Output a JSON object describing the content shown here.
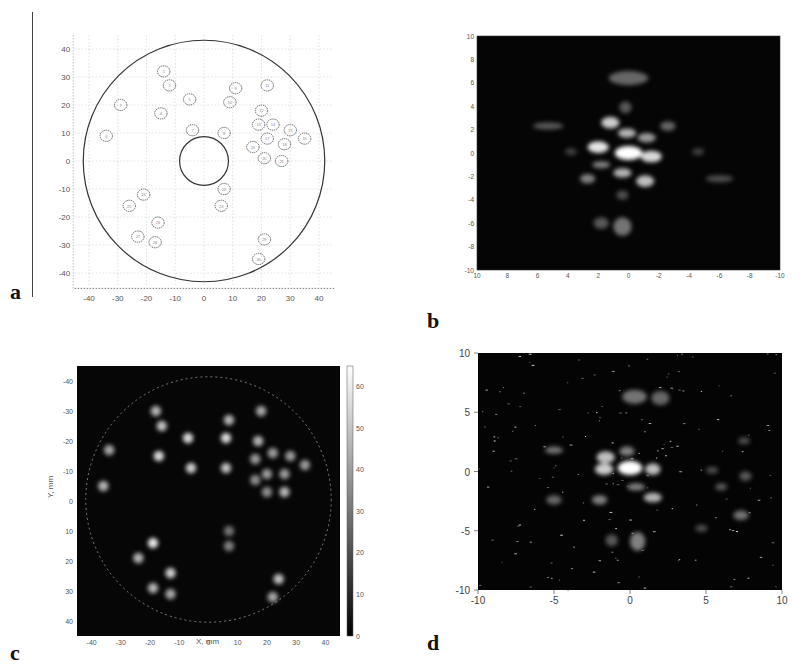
{
  "panels": {
    "a": {
      "label": "a"
    },
    "b": {
      "label": "b"
    },
    "c": {
      "label": "c",
      "xlabel": "X, mm",
      "ylabel": "Y, mm"
    },
    "d": {
      "label": "d"
    }
  },
  "chart_data": [
    {
      "id": "a",
      "type": "scatter",
      "title": "",
      "description": "Layout of circular test defects inside a disk of radius ~42 mm with central hole radius ~8.5 mm",
      "xlabel": "",
      "ylabel": "",
      "xlim": [
        -45,
        45
      ],
      "ylim": [
        -45,
        45
      ],
      "xticks": [
        "-40",
        "-30",
        "-20",
        "-10",
        "0",
        "10",
        "20",
        "30",
        "40"
      ],
      "yticks": [
        "40",
        "30",
        "20",
        "10",
        "0",
        "-10",
        "-20",
        "-30",
        "-40"
      ],
      "grid": true,
      "outer_circle": {
        "cx": 0,
        "cy": 0,
        "r": 42
      },
      "inner_circle": {
        "cx": 0,
        "cy": 0,
        "r": 8.5
      },
      "points": [
        {
          "x": -14,
          "y": 32
        },
        {
          "x": -12,
          "y": 27
        },
        {
          "x": -29,
          "y": 20
        },
        {
          "x": -15,
          "y": 17
        },
        {
          "x": -5,
          "y": 22
        },
        {
          "x": -34,
          "y": 9
        },
        {
          "x": -4,
          "y": 11
        },
        {
          "x": 7,
          "y": 10
        },
        {
          "x": 11,
          "y": 26
        },
        {
          "x": 9,
          "y": 21
        },
        {
          "x": 22,
          "y": 27
        },
        {
          "x": 20,
          "y": 18
        },
        {
          "x": 19,
          "y": 13
        },
        {
          "x": 24,
          "y": 13
        },
        {
          "x": 30,
          "y": 11
        },
        {
          "x": 35,
          "y": 8
        },
        {
          "x": 22,
          "y": 8
        },
        {
          "x": 28,
          "y": 6
        },
        {
          "x": 17,
          "y": 5
        },
        {
          "x": 21,
          "y": 1
        },
        {
          "x": 27,
          "y": 0
        },
        {
          "x": 7,
          "y": -10
        },
        {
          "x": 6,
          "y": -16
        },
        {
          "x": -21,
          "y": -12
        },
        {
          "x": -26,
          "y": -16
        },
        {
          "x": -16,
          "y": -22
        },
        {
          "x": -23,
          "y": -27
        },
        {
          "x": -17,
          "y": -29
        },
        {
          "x": 21,
          "y": -28
        },
        {
          "x": 19,
          "y": -35
        }
      ]
    },
    {
      "id": "b",
      "type": "heatmap",
      "title": "",
      "xlabel": "",
      "ylabel": "",
      "xlim": [
        10,
        -10
      ],
      "ylim": [
        -10,
        10
      ],
      "xticks": [
        "10",
        "8",
        "6",
        "4",
        "2",
        "0",
        "-2",
        "-4",
        "-6",
        "-8",
        "-10"
      ],
      "yticks": [
        "10",
        "8",
        "6",
        "4",
        "2",
        "0",
        "-2",
        "-4",
        "-6",
        "-8",
        "-10"
      ],
      "colormap": "gray",
      "blobs": [
        {
          "x": 0,
          "y": 0,
          "i": 1.0,
          "rx": 0.9,
          "ry": 0.6
        },
        {
          "x": 1.2,
          "y": 2.6,
          "i": 0.8,
          "rx": 0.6,
          "ry": 0.5
        },
        {
          "x": 0.1,
          "y": 1.7,
          "i": 0.7,
          "rx": 0.6,
          "ry": 0.4
        },
        {
          "x": 2.0,
          "y": 0.5,
          "i": 0.9,
          "rx": 0.7,
          "ry": 0.5
        },
        {
          "x": -1.5,
          "y": -0.3,
          "i": 0.85,
          "rx": 0.7,
          "ry": 0.5
        },
        {
          "x": -1.2,
          "y": 1.3,
          "i": 0.6,
          "rx": 0.6,
          "ry": 0.4
        },
        {
          "x": 0.4,
          "y": -1.7,
          "i": 0.7,
          "rx": 0.6,
          "ry": 0.4
        },
        {
          "x": -1.1,
          "y": -2.4,
          "i": 0.75,
          "rx": 0.6,
          "ry": 0.5
        },
        {
          "x": 1.8,
          "y": -1.0,
          "i": 0.5,
          "rx": 0.6,
          "ry": 0.3
        },
        {
          "x": 2.7,
          "y": -2.2,
          "i": 0.5,
          "rx": 0.5,
          "ry": 0.4
        },
        {
          "x": 0.0,
          "y": 6.4,
          "i": 0.4,
          "rx": 1.3,
          "ry": 0.6
        },
        {
          "x": 0.2,
          "y": 3.9,
          "i": 0.35,
          "rx": 0.4,
          "ry": 0.5
        },
        {
          "x": -2.6,
          "y": 2.3,
          "i": 0.4,
          "rx": 0.5,
          "ry": 0.4
        },
        {
          "x": 5.3,
          "y": 2.3,
          "i": 0.35,
          "rx": 1.0,
          "ry": 0.3
        },
        {
          "x": 3.8,
          "y": 0.1,
          "i": 0.25,
          "rx": 0.4,
          "ry": 0.3
        },
        {
          "x": -4.6,
          "y": 0.1,
          "i": 0.25,
          "rx": 0.4,
          "ry": 0.3
        },
        {
          "x": -6.0,
          "y": -2.2,
          "i": 0.3,
          "rx": 0.9,
          "ry": 0.3
        },
        {
          "x": 0.4,
          "y": -3.6,
          "i": 0.3,
          "rx": 0.4,
          "ry": 0.4
        },
        {
          "x": 0.4,
          "y": -6.3,
          "i": 0.45,
          "rx": 0.6,
          "ry": 0.8
        },
        {
          "x": 1.8,
          "y": -6.0,
          "i": 0.35,
          "rx": 0.5,
          "ry": 0.5
        }
      ]
    },
    {
      "id": "c",
      "type": "heatmap",
      "title": "",
      "xlabel": "X, mm",
      "ylabel": "Y, mm",
      "xlim": [
        -45,
        45
      ],
      "ylim": [
        -45,
        45
      ],
      "xticks": [
        "-40",
        "-30",
        "-20",
        "-10",
        "0",
        "10",
        "20",
        "30",
        "40"
      ],
      "yticks": [
        "-40",
        "-30",
        "-20",
        "-10",
        "0",
        "10",
        "20",
        "30",
        "40"
      ],
      "colormap": "gray",
      "colorbar": {
        "min": 0,
        "max": 65,
        "ticks": [
          "0",
          "10",
          "20",
          "30",
          "40",
          "50",
          "60"
        ]
      },
      "blobs": [
        {
          "x": -18,
          "y": -30,
          "i": 0.7
        },
        {
          "x": -16,
          "y": -25,
          "i": 0.75
        },
        {
          "x": -34,
          "y": -17,
          "i": 0.65
        },
        {
          "x": -17,
          "y": -15,
          "i": 0.85
        },
        {
          "x": -7,
          "y": -21,
          "i": 0.85
        },
        {
          "x": -36,
          "y": -5,
          "i": 0.7
        },
        {
          "x": -6,
          "y": -11,
          "i": 0.8
        },
        {
          "x": 6,
          "y": -11,
          "i": 0.75
        },
        {
          "x": 7,
          "y": -27,
          "i": 0.7
        },
        {
          "x": 6,
          "y": -21,
          "i": 0.85
        },
        {
          "x": 18,
          "y": -30,
          "i": 0.65
        },
        {
          "x": 17,
          "y": -20,
          "i": 0.7
        },
        {
          "x": 16,
          "y": -14,
          "i": 0.6
        },
        {
          "x": 22,
          "y": -16,
          "i": 0.6
        },
        {
          "x": 28,
          "y": -15,
          "i": 0.6
        },
        {
          "x": 33,
          "y": -12,
          "i": 0.6
        },
        {
          "x": 20,
          "y": -9,
          "i": 0.6
        },
        {
          "x": 26,
          "y": -9,
          "i": 0.6
        },
        {
          "x": 16,
          "y": -7,
          "i": 0.55
        },
        {
          "x": 20,
          "y": -3,
          "i": 0.55
        },
        {
          "x": 26,
          "y": -3,
          "i": 0.7
        },
        {
          "x": 7,
          "y": 10,
          "i": 0.45
        },
        {
          "x": 7,
          "y": 15,
          "i": 0.5
        },
        {
          "x": -19,
          "y": 14,
          "i": 0.9
        },
        {
          "x": -24,
          "y": 19,
          "i": 0.7
        },
        {
          "x": -13,
          "y": 24,
          "i": 0.8
        },
        {
          "x": -19,
          "y": 29,
          "i": 0.7
        },
        {
          "x": -13,
          "y": 31,
          "i": 0.65
        },
        {
          "x": 24,
          "y": 26,
          "i": 0.75
        },
        {
          "x": 22,
          "y": 32,
          "i": 0.65
        }
      ]
    },
    {
      "id": "d",
      "type": "heatmap",
      "title": "",
      "xlabel": "",
      "ylabel": "",
      "xlim": [
        -10,
        10
      ],
      "ylim": [
        -10,
        10
      ],
      "xticks": [
        "-10",
        "-5",
        "0",
        "5",
        "10"
      ],
      "yticks": [
        "10",
        "5",
        "0",
        "-5",
        "-10"
      ],
      "colormap": "gray",
      "blobs": [
        {
          "x": 0,
          "y": 0.3,
          "i": 1.0,
          "rx": 0.8,
          "ry": 0.6
        },
        {
          "x": -1.6,
          "y": 1.2,
          "i": 0.75,
          "rx": 0.6,
          "ry": 0.5
        },
        {
          "x": -1.7,
          "y": 0.2,
          "i": 0.8,
          "rx": 0.6,
          "ry": 0.5
        },
        {
          "x": -0.2,
          "y": 1.7,
          "i": 0.5,
          "rx": 0.5,
          "ry": 0.4
        },
        {
          "x": 1.5,
          "y": 0.2,
          "i": 0.75,
          "rx": 0.5,
          "ry": 0.5
        },
        {
          "x": 1.5,
          "y": -2.2,
          "i": 0.7,
          "rx": 0.6,
          "ry": 0.4
        },
        {
          "x": 0.4,
          "y": -1.3,
          "i": 0.5,
          "rx": 0.6,
          "ry": 0.3
        },
        {
          "x": -2.0,
          "y": -2.4,
          "i": 0.5,
          "rx": 0.5,
          "ry": 0.4
        },
        {
          "x": 0.3,
          "y": 6.3,
          "i": 0.45,
          "rx": 0.8,
          "ry": 0.6
        },
        {
          "x": 2.0,
          "y": 6.2,
          "i": 0.4,
          "rx": 0.6,
          "ry": 0.6
        },
        {
          "x": 0.5,
          "y": -5.9,
          "i": 0.5,
          "rx": 0.5,
          "ry": 0.8
        },
        {
          "x": -1.2,
          "y": -5.8,
          "i": 0.35,
          "rx": 0.4,
          "ry": 0.5
        },
        {
          "x": -5.0,
          "y": 1.8,
          "i": 0.45,
          "rx": 0.6,
          "ry": 0.3
        },
        {
          "x": -5.0,
          "y": -2.4,
          "i": 0.4,
          "rx": 0.5,
          "ry": 0.4
        },
        {
          "x": 6.0,
          "y": -1.3,
          "i": 0.35,
          "rx": 0.4,
          "ry": 0.3
        },
        {
          "x": 7.3,
          "y": -3.7,
          "i": 0.45,
          "rx": 0.5,
          "ry": 0.4
        },
        {
          "x": 7.6,
          "y": -0.4,
          "i": 0.35,
          "rx": 0.4,
          "ry": 0.4
        },
        {
          "x": 5.4,
          "y": 0.1,
          "i": 0.3,
          "rx": 0.4,
          "ry": 0.3
        },
        {
          "x": 7.5,
          "y": 2.6,
          "i": 0.3,
          "rx": 0.4,
          "ry": 0.3
        },
        {
          "x": 4.7,
          "y": -4.8,
          "i": 0.3,
          "rx": 0.4,
          "ry": 0.3
        }
      ]
    }
  ]
}
